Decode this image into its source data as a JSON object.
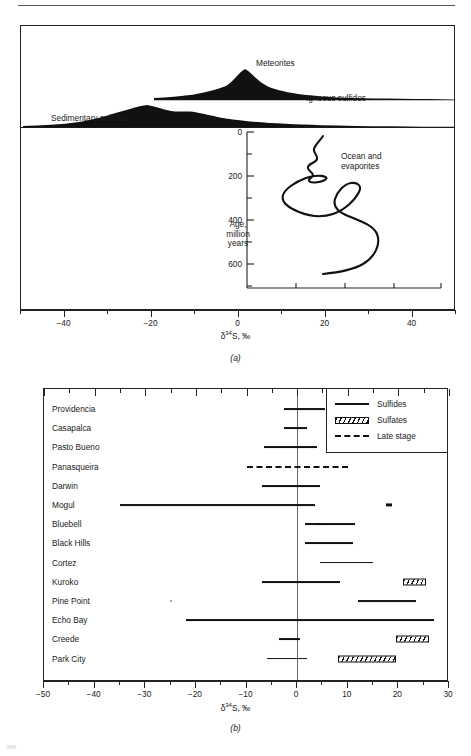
{
  "figure": {
    "page_folio": "388",
    "axis_title_html": "δ34S, ‰",
    "panel_a_caption": "(a)",
    "panel_b_caption": "(b)"
  },
  "panel_a": {
    "labels": {
      "meteorites": "Meteorites",
      "igneous_sulfides": "Igneous sulfides",
      "sedimentary_sulfides": "Sedimentary sulfides",
      "ocean_evaporites": "Ocean and evaporites",
      "age_axis": "Age, million years"
    },
    "x_axis": {
      "min": -50,
      "max": 50,
      "major_ticks": [
        -40,
        -20,
        0,
        20,
        40
      ],
      "major_labels": [
        "−40",
        "−20",
        "0",
        "20",
        "40"
      ],
      "minor_ticks": [
        -50,
        -30,
        -10,
        10,
        30,
        50
      ]
    },
    "age_axis": {
      "min": 0,
      "max": 700,
      "major_ticks": [
        0,
        200,
        400,
        600
      ],
      "major_labels": [
        "0",
        "200",
        "400",
        "600"
      ],
      "minor_ticks": [
        100,
        300,
        500,
        700
      ]
    }
  },
  "panel_b": {
    "legend": {
      "title": "",
      "items": [
        {
          "key": "solid",
          "label": "Sulfides"
        },
        {
          "key": "hatched",
          "label": "Sulfates"
        },
        {
          "key": "dashed",
          "label": "Late stage"
        }
      ]
    },
    "x_axis": {
      "min": -50,
      "max": 30,
      "major_ticks": [
        -50,
        -40,
        -30,
        -20,
        -10,
        0,
        10,
        20,
        30
      ],
      "major_labels": [
        "−50",
        "−40",
        "−30",
        "−20",
        "−10",
        "0",
        "10",
        "20",
        "30"
      ],
      "minor_ticks": [
        -45,
        -35,
        -25,
        -15,
        -5,
        5,
        15,
        25
      ]
    },
    "rows": [
      {
        "name": "Providencia",
        "sulfides": [
          -2.5,
          5.5
        ]
      },
      {
        "name": "Casapalca",
        "sulfides": [
          -2.5,
          2.0
        ]
      },
      {
        "name": "Pasto Bueno",
        "sulfides": [
          -6.5,
          4.0
        ]
      },
      {
        "name": "Panasqueira",
        "late_stage": [
          -10.0,
          10.0
        ]
      },
      {
        "name": "Darwin",
        "sulfides": [
          -7.0,
          4.5
        ]
      },
      {
        "name": "Mogul",
        "sulfides": [
          -35.0,
          3.5
        ],
        "sulfates_small": [
          17.5,
          18.8
        ]
      },
      {
        "name": "Bluebell",
        "sulfides": [
          1.5,
          11.5
        ],
        "late_stage": [
          1.5,
          5.0
        ]
      },
      {
        "name": "Black Hills",
        "sulfides": [
          1.5,
          11.0
        ]
      },
      {
        "name": "Cortez",
        "sulfides": [
          4.5,
          15.0
        ]
      },
      {
        "name": "Kuroko",
        "sulfides": [
          -7.0,
          8.5
        ],
        "sulfates": [
          21.0,
          25.5
        ]
      },
      {
        "name": "Pine Point",
        "sulfides": [
          12.0,
          23.5
        ],
        "dot": -25.0
      },
      {
        "name": "Echo Bay",
        "sulfides": [
          -22.0,
          27.0
        ]
      },
      {
        "name": "Creede",
        "sulfides": [
          -3.5,
          0.5
        ],
        "sulfates": [
          19.5,
          26.0
        ]
      },
      {
        "name": "Park City",
        "sulfides": [
          -6.0,
          2.0
        ],
        "sulfates": [
          8.0,
          19.5
        ]
      }
    ]
  },
  "chart_data": [
    {
      "type": "area",
      "title": "Sulfur isotope distributions in natural reservoirs",
      "xlabel": "δ34S, ‰",
      "xlim": [
        -50,
        50
      ],
      "panel": "(a)",
      "series": [
        {
          "name": "Meteorites",
          "kind": "spike",
          "center": 0.5,
          "halfwidth": 1.2,
          "peak": 1.0
        },
        {
          "name": "Igneous sulfides",
          "kind": "frequency-curve",
          "range": [
            -19,
            38
          ],
          "mode": 2.0,
          "x": [
            -19,
            -14,
            -9,
            -4,
            0,
            2,
            5,
            9,
            14,
            20,
            26,
            32,
            38
          ],
          "y": [
            0.02,
            0.05,
            0.1,
            0.3,
            0.72,
            1.0,
            0.7,
            0.3,
            0.12,
            0.06,
            0.04,
            0.02,
            0.01
          ]
        },
        {
          "name": "Sedimentary sulfides",
          "kind": "frequency-curve",
          "range": [
            -47,
            42
          ],
          "mode": -14.0,
          "x": [
            -47,
            -40,
            -34,
            -28,
            -22,
            -18,
            -14,
            -10,
            -6,
            -2,
            4,
            10,
            16,
            24,
            34,
            42
          ],
          "y": [
            0.02,
            0.06,
            0.14,
            0.3,
            0.52,
            0.78,
            1.0,
            0.8,
            0.86,
            0.62,
            0.44,
            0.3,
            0.2,
            0.12,
            0.05,
            0.02
          ]
        },
        {
          "name": "Ocean and evaporites",
          "kind": "age-curve",
          "ylabel": "Age, million years",
          "ylim": [
            0,
            700
          ],
          "yinvert": true,
          "points": [
            {
              "age": 0,
              "d34s": 21.0
            },
            {
              "age": 30,
              "d34s": 19.5
            },
            {
              "age": 60,
              "d34s": 17.5
            },
            {
              "age": 90,
              "d34s": 18.5
            },
            {
              "age": 120,
              "d34s": 16.8
            },
            {
              "age": 150,
              "d34s": 18.2
            },
            {
              "age": 170,
              "d34s": 16.5
            },
            {
              "age": 185,
              "d34s": 18.0
            },
            {
              "age": 200,
              "d34s": 22.0
            },
            {
              "age": 225,
              "d34s": 16.0
            },
            {
              "age": 250,
              "d34s": 11.5
            },
            {
              "age": 290,
              "d34s": 12.5
            },
            {
              "age": 330,
              "d34s": 22.0
            },
            {
              "age": 355,
              "d34s": 28.5
            },
            {
              "age": 380,
              "d34s": 22.5
            },
            {
              "age": 400,
              "d34s": 20.5
            },
            {
              "age": 430,
              "d34s": 26.0
            },
            {
              "age": 470,
              "d34s": 30.0
            },
            {
              "age": 520,
              "d34s": 31.5
            },
            {
              "age": 570,
              "d34s": 29.0
            },
            {
              "age": 620,
              "d34s": 22.0
            },
            {
              "age": 660,
              "d34s": 18.5
            }
          ]
        }
      ]
    },
    {
      "type": "bar",
      "title": "δ34S ranges of ore deposits",
      "xlabel": "δ34S, ‰",
      "xlim": [
        -50,
        30
      ],
      "panel": "(b)",
      "categories": [
        "Providencia",
        "Casapalca",
        "Pasto Bueno",
        "Panasqueira",
        "Darwin",
        "Mogul",
        "Bluebell",
        "Black Hills",
        "Cortez",
        "Kuroko",
        "Pine Point",
        "Echo Bay",
        "Creede",
        "Park City"
      ],
      "series": [
        {
          "name": "Sulfides",
          "style": "solid-line",
          "ranges": [
            [
              -2.5,
              5.5
            ],
            [
              -2.5,
              2.0
            ],
            [
              -6.5,
              4.0
            ],
            null,
            [
              -7.0,
              4.5
            ],
            [
              -35.0,
              3.5
            ],
            [
              1.5,
              11.5
            ],
            [
              1.5,
              11.0
            ],
            [
              4.5,
              15.0
            ],
            [
              -7.0,
              8.5
            ],
            [
              12.0,
              23.5
            ],
            [
              -22.0,
              27.0
            ],
            [
              -3.5,
              0.5
            ],
            [
              -6.0,
              2.0
            ]
          ]
        },
        {
          "name": "Sulfates",
          "style": "hatched-bar",
          "ranges": [
            null,
            null,
            null,
            null,
            null,
            [
              17.5,
              18.8
            ],
            null,
            null,
            null,
            [
              21.0,
              25.5
            ],
            null,
            null,
            [
              19.5,
              26.0
            ],
            [
              8.0,
              19.5
            ]
          ]
        },
        {
          "name": "Late stage",
          "style": "dashed-line",
          "ranges": [
            null,
            null,
            null,
            [
              -10.0,
              10.0
            ],
            null,
            null,
            [
              1.5,
              5.0
            ],
            null,
            null,
            null,
            null,
            null,
            null,
            null
          ]
        }
      ]
    }
  ]
}
